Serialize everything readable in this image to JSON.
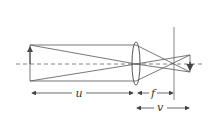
{
  "diagram": {
    "labels": {
      "object_distance": "u",
      "focal_length": "f",
      "image_distance": "v"
    },
    "colors": {
      "line": "#555555",
      "background": "#ffffff"
    }
  }
}
